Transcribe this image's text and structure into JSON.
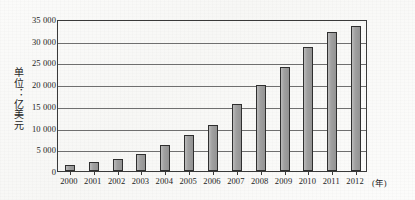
{
  "chart_data": {
    "type": "bar",
    "title": "",
    "subtitle": "",
    "xlabel": "(年)",
    "ylabel": "单位：亿美元",
    "categories": [
      "2000",
      "2001",
      "2002",
      "2003",
      "2004",
      "2005",
      "2006",
      "2007",
      "2008",
      "2009",
      "2010",
      "2011",
      "2012"
    ],
    "values": [
      1500,
      2000,
      2700,
      3900,
      5900,
      8300,
      10700,
      15400,
      19800,
      24000,
      28500,
      32000,
      33500
    ],
    "series": [
      {
        "name": "",
        "values": [
          1500,
          2000,
          2700,
          3900,
          5900,
          8300,
          10700,
          15400,
          19800,
          24000,
          28500,
          32000,
          33500
        ]
      }
    ],
    "ylim": [
      0,
      35000
    ],
    "ytick_values": [
      0,
      5000,
      10000,
      15000,
      20000,
      25000,
      30000,
      35000
    ],
    "ytick_labels": [
      "0",
      "5 000",
      "10 000",
      "15 000",
      "20 000",
      "25 000",
      "30 000",
      "35 000"
    ],
    "grid": true,
    "grid_axis": "y",
    "legend": false,
    "legend_position": "none",
    "bar_color": "#9b9b9b",
    "bar_edge_color": "#2f2f2f",
    "gridline_color": "#6f6f6f",
    "frame_color": "#3a3a3a",
    "background_color": "#fbfbfa"
  }
}
